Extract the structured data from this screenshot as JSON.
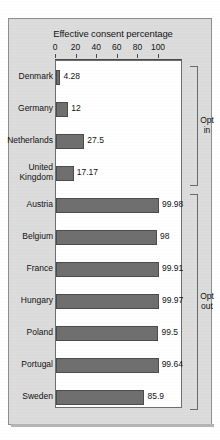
{
  "chart_data": {
    "type": "bar",
    "orientation": "horizontal",
    "title": "Effective consent percentage",
    "xlabel": "",
    "ylabel": "",
    "xlim": [
      0,
      110
    ],
    "grid": false,
    "xticks": [
      0,
      20,
      40,
      60,
      80,
      100
    ],
    "xtick_labels": [
      "0",
      "20",
      "40",
      "60",
      "80",
      "100"
    ],
    "categories": [
      "Denmark",
      "Germany",
      "Netherlands",
      "United\nKingdom",
      "Austria",
      "Belgium",
      "France",
      "Hungary",
      "Poland",
      "Portugal",
      "Sweden"
    ],
    "values": [
      4.28,
      12,
      27.5,
      17.17,
      99.98,
      98,
      99.91,
      99.97,
      99.5,
      99.64,
      85.9
    ],
    "value_labels": [
      "4.28",
      "12",
      "27.5",
      "17.17",
      "99.98",
      "98",
      "99.91",
      "99.97",
      "99.5",
      "99.64",
      "85.9"
    ],
    "groups": [
      {
        "label": "Opt\nin",
        "start_index": 0,
        "end_index": 3
      },
      {
        "label": "Opt\nout",
        "start_index": 4,
        "end_index": 10
      }
    ],
    "colors": {
      "bar_fill": "#6f6f6f",
      "bar_edge": "#4c4c4c",
      "plot_background": "#ffffff",
      "panel_background": "#dcdcdc",
      "text": "#111111",
      "axis": "#4a4a4a"
    }
  }
}
